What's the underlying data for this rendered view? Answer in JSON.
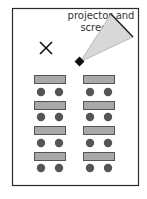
{
  "diagram": {
    "label": "projector and screen",
    "label_lines": [
      "projector and",
      "screen"
    ],
    "colors": {
      "border": "#2a2a2a",
      "table_fill": "#a9a9a9",
      "table_stroke": "#555555",
      "chair": "#555555",
      "screen_fill": "#d8d8d8",
      "projector": "#111111"
    },
    "rows": 4,
    "columns": 2,
    "tables_per_row": 2,
    "chairs_per_table": 2,
    "marker": "X"
  }
}
